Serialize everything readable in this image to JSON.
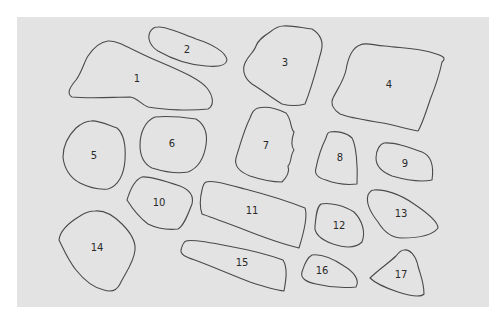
{
  "diagram": {
    "background": "#e3e3e3",
    "stroke": "#4a4a4a",
    "shapes": [
      {
        "id": 1,
        "label": "1"
      },
      {
        "id": 2,
        "label": "2"
      },
      {
        "id": 3,
        "label": "3"
      },
      {
        "id": 4,
        "label": "4"
      },
      {
        "id": 5,
        "label": "5"
      },
      {
        "id": 6,
        "label": "6"
      },
      {
        "id": 7,
        "label": "7"
      },
      {
        "id": 8,
        "label": "8"
      },
      {
        "id": 9,
        "label": "9"
      },
      {
        "id": 10,
        "label": "10"
      },
      {
        "id": 11,
        "label": "11"
      },
      {
        "id": 12,
        "label": "12"
      },
      {
        "id": 13,
        "label": "13"
      },
      {
        "id": 14,
        "label": "14"
      },
      {
        "id": 15,
        "label": "15"
      },
      {
        "id": 16,
        "label": "16"
      },
      {
        "id": 17,
        "label": "17"
      }
    ]
  }
}
